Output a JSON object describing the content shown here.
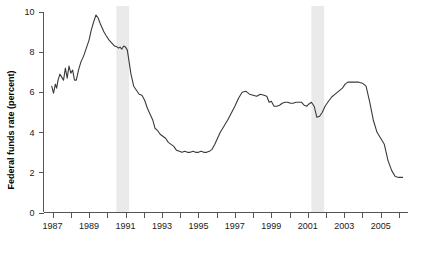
{
  "chart_data": {
    "type": "line",
    "title": "",
    "subtitle": "",
    "xlabel": "",
    "ylabel": "Federal funds rate (percent)",
    "ylim": [
      0,
      10
    ],
    "xlim": [
      1986.5,
      2006.5
    ],
    "grid": false,
    "legend": null,
    "y_ticks": [
      0,
      2,
      4,
      6,
      8,
      10
    ],
    "y_tick_labels": [
      "0",
      "2",
      "4",
      "6",
      "8",
      "10"
    ],
    "x_ticks": [
      1987,
      1988,
      1989,
      1990,
      1991,
      1992,
      1993,
      1994,
      1995,
      1996,
      1997,
      1998,
      1999,
      2000,
      2001,
      2002,
      2003,
      2004,
      2005,
      2006
    ],
    "x_tick_labels_shown": [
      "1987",
      "1989",
      "1991",
      "1993",
      "1995",
      "1997",
      "1999",
      "2001",
      "2003",
      "2005"
    ],
    "x_tick_labels_years": [
      1987,
      1989,
      1991,
      1993,
      1995,
      1997,
      1999,
      2001,
      2003,
      2005
    ],
    "annotations": [
      {
        "name": "recession-band-1990",
        "start": 1990.5,
        "end": 1991.2,
        "label": "recession"
      },
      {
        "name": "recession-band-2001",
        "start": 2001.2,
        "end": 2001.9,
        "label": "recession"
      }
    ],
    "colors": {
      "line": "#3a3a3a",
      "recession_band": "#eaeaea",
      "axis": "#555555",
      "text": "#000000",
      "background": "#ffffff"
    },
    "series": [
      {
        "name": "Federal funds rate",
        "x": [
          1986.95,
          1987.05,
          1987.15,
          1987.22,
          1987.3,
          1987.4,
          1987.5,
          1987.6,
          1987.7,
          1987.8,
          1987.9,
          1988.0,
          1988.1,
          1988.2,
          1988.3,
          1988.42,
          1988.55,
          1988.7,
          1988.85,
          1989.0,
          1989.12,
          1989.25,
          1989.38,
          1989.5,
          1989.62,
          1989.72,
          1989.82,
          1989.95,
          1990.1,
          1990.25,
          1990.4,
          1990.55,
          1990.62,
          1990.7,
          1990.8,
          1990.9,
          1991.0,
          1991.1,
          1991.2,
          1991.3,
          1991.45,
          1991.6,
          1991.75,
          1991.9,
          1992.05,
          1992.2,
          1992.35,
          1992.5,
          1992.62,
          1992.75,
          1992.9,
          1993.05,
          1993.2,
          1993.35,
          1993.5,
          1993.65,
          1993.8,
          1993.95,
          1994.1,
          1994.25,
          1994.4,
          1994.55,
          1994.7,
          1994.85,
          1995.0,
          1995.15,
          1995.3,
          1995.45,
          1995.6,
          1995.75,
          1995.9,
          1996.05,
          1996.2,
          1996.4,
          1996.6,
          1996.8,
          1997.0,
          1997.2,
          1997.4,
          1997.6,
          1997.8,
          1998.0,
          1998.2,
          1998.4,
          1998.6,
          1998.75,
          1998.88,
          1999.0,
          1999.15,
          1999.3,
          1999.45,
          1999.6,
          1999.75,
          1999.9,
          2000.05,
          2000.2,
          2000.35,
          2000.5,
          2000.65,
          2000.8,
          2000.95,
          2001.05,
          2001.2,
          2001.35,
          2001.5,
          2001.65,
          2001.8,
          2001.95,
          2002.1,
          2002.3,
          2002.5,
          2002.7,
          2002.9,
          2003.05,
          2003.2,
          2003.4,
          2003.6,
          2003.8,
          2004.0,
          2004.2,
          2004.4,
          2004.6,
          2004.8,
          2005.0,
          2005.2,
          2005.4,
          2005.6,
          2005.8,
          2006.0,
          2006.1,
          2006.2
        ],
        "y": [
          6.3,
          5.95,
          6.4,
          6.2,
          6.6,
          6.9,
          6.75,
          6.6,
          7.2,
          6.7,
          7.3,
          6.95,
          7.1,
          6.6,
          6.6,
          7.1,
          7.5,
          7.8,
          8.2,
          8.6,
          9.1,
          9.5,
          9.85,
          9.7,
          9.4,
          9.2,
          9.0,
          8.8,
          8.6,
          8.45,
          8.3,
          8.25,
          8.2,
          8.25,
          8.15,
          8.3,
          8.25,
          8.1,
          7.5,
          6.9,
          6.3,
          6.1,
          5.9,
          5.85,
          5.6,
          5.2,
          4.9,
          4.6,
          4.2,
          4.1,
          3.9,
          3.8,
          3.7,
          3.5,
          3.4,
          3.3,
          3.1,
          3.05,
          3.0,
          3.05,
          3.0,
          3.0,
          3.05,
          3.0,
          3.0,
          3.05,
          3.0,
          3.0,
          3.05,
          3.15,
          3.4,
          3.7,
          4.0,
          4.3,
          4.6,
          4.95,
          5.3,
          5.7,
          6.0,
          6.05,
          5.9,
          5.85,
          5.8,
          5.9,
          5.85,
          5.8,
          5.5,
          5.55,
          5.3,
          5.3,
          5.35,
          5.45,
          5.5,
          5.5,
          5.45,
          5.45,
          5.5,
          5.5,
          5.5,
          5.35,
          5.3,
          5.4,
          5.5,
          5.3,
          4.75,
          4.8,
          5.0,
          5.3,
          5.5,
          5.75,
          5.9,
          6.05,
          6.2,
          6.4,
          6.5,
          6.5,
          6.5,
          6.5,
          6.45,
          6.3,
          5.5,
          4.6,
          4.0,
          3.7,
          3.4,
          2.6,
          2.1,
          1.8,
          1.75,
          1.75,
          1.75
        ]
      }
    ],
    "series_note": "Federal funds rate monthly series 1987-2006"
  },
  "axis": {
    "y_axis_label": "Federal funds rate (percent)"
  }
}
